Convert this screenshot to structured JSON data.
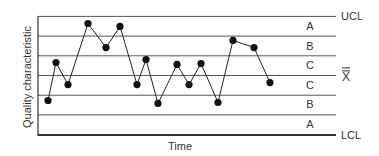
{
  "chart_data": {
    "type": "line",
    "title": "",
    "xlabel": "Time",
    "ylabel": "Quality characteristic",
    "units": "standard deviations from center line (X-double-bar)",
    "x": [
      1,
      2,
      3,
      4,
      5,
      6,
      7,
      8,
      9,
      10,
      11,
      12,
      13,
      14,
      15,
      16
    ],
    "values": [
      -1.27,
      0.66,
      -0.46,
      2.64,
      1.42,
      2.49,
      -0.46,
      0.81,
      -1.42,
      0.56,
      -0.46,
      0.61,
      -1.37,
      1.78,
      1.42,
      -0.36
    ],
    "ylim": [
      -3,
      3
    ],
    "grid": true,
    "control_lines": {
      "UCL": 3,
      "center": 0,
      "LCL": -3,
      "center_label": "X̿"
    },
    "zones": [
      {
        "label": "A",
        "range": [
          2,
          3
        ]
      },
      {
        "label": "B",
        "range": [
          1,
          2
        ]
      },
      {
        "label": "C",
        "range": [
          0,
          1
        ]
      },
      {
        "label": "C",
        "range": [
          -1,
          0
        ]
      },
      {
        "label": "B",
        "range": [
          -2,
          -1
        ]
      },
      {
        "label": "A",
        "range": [
          -3,
          -2
        ]
      }
    ],
    "right_labels": [
      "UCL",
      "X̿",
      "LCL"
    ],
    "legend": null
  },
  "labels": {
    "ylabel": "Quality characteristic",
    "xlabel": "Time",
    "ucl": "UCL",
    "lcl": "LCL",
    "center": "X",
    "zones": [
      "A",
      "B",
      "C",
      "C",
      "B",
      "A"
    ]
  },
  "colors": {
    "line": "#222222",
    "grid": "#555555",
    "axis": "#333333",
    "marker": "#111111"
  }
}
